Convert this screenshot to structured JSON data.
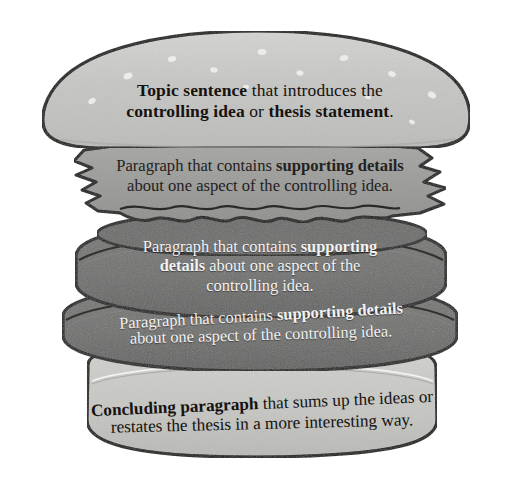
{
  "diagram": {
    "colors": {
      "background": "#ffffff",
      "outline": "#100d0b",
      "bun_top": "#c6c6c4",
      "bun_top_highlight": "#e8e8e6",
      "bun_bottom": "#c9c9c6",
      "lettuce": "#9a9a98",
      "patty": "#6f6f6e",
      "patty_shadow": "#5d5d5c",
      "text_dark": "#15120f",
      "text_light": "#f3f3f3"
    },
    "layers": [
      {
        "id": "top-bun",
        "name": "top-bun",
        "role": "Topic sentence",
        "text_color": "dark",
        "lines": [
          [
            {
              "t": "Topic sentence",
              "b": true
            },
            {
              "t": " that introduces the",
              "b": false
            }
          ],
          [
            {
              "t": "controlling idea",
              "b": true
            },
            {
              "t": " or ",
              "b": false
            },
            {
              "t": "thesis statement",
              "b": true
            },
            {
              "t": ".",
              "b": false
            }
          ]
        ]
      },
      {
        "id": "lettuce",
        "name": "lettuce",
        "role": "Supporting paragraph 1",
        "text_color": "dark",
        "lines": [
          [
            {
              "t": "Paragraph that contains ",
              "b": false
            },
            {
              "t": "supporting details",
              "b": true
            }
          ],
          [
            {
              "t": "about one aspect of the controlling idea.",
              "b": false
            }
          ]
        ]
      },
      {
        "id": "patty-1",
        "name": "patty-top",
        "role": "Supporting paragraph 2",
        "text_color": "light",
        "lines": [
          [
            {
              "t": "Paragraph that contains ",
              "b": false
            },
            {
              "t": "supporting",
              "b": true
            }
          ],
          [
            {
              "t": "details",
              "b": true
            },
            {
              "t": " about one aspect of the",
              "b": false
            }
          ],
          [
            {
              "t": "controlling idea.",
              "b": false
            }
          ]
        ]
      },
      {
        "id": "patty-2",
        "name": "patty-bottom",
        "role": "Supporting paragraph 3",
        "text_color": "light",
        "lines": [
          [
            {
              "t": "Paragraph that contains ",
              "b": false
            },
            {
              "t": "supporting details",
              "b": true
            }
          ],
          [
            {
              "t": "about one aspect of the controlling idea.",
              "b": false
            }
          ]
        ]
      },
      {
        "id": "bottom-bun",
        "name": "bottom-bun",
        "role": "Concluding paragraph",
        "text_color": "dark",
        "lines": [
          [
            {
              "t": "Concluding paragraph",
              "b": true
            },
            {
              "t": " that sums up the ideas or",
              "b": false
            }
          ],
          [
            {
              "t": "restates the thesis in a more interesting way.",
              "b": false
            }
          ]
        ]
      }
    ]
  }
}
